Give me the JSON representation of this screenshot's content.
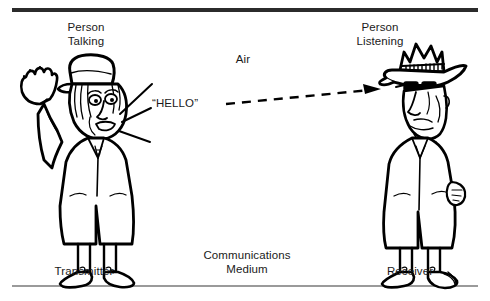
{
  "figure": {
    "title_visible": false,
    "background_color": "#ffffff",
    "ink_color": "#000000",
    "rules": {
      "top_color": "#2b2b2b",
      "bottom_color": "#9a9a9a"
    },
    "labels": {
      "person_talking": "Person\nTalking",
      "person_listening": "Person\nListening",
      "air": "Air",
      "hello": "“HELLO”",
      "communications_medium": "Communications\nMedium",
      "transmitter": "Transmitter",
      "receiver": "Receiver"
    },
    "icons": {
      "talking_person": "waving-man-with-cap-icon",
      "listening_person": "man-with-wide-brim-hat-and-sunglasses-icon",
      "sound_rays": "speech-rays-icon",
      "signal_path": "dashed-arrow-icon"
    }
  }
}
